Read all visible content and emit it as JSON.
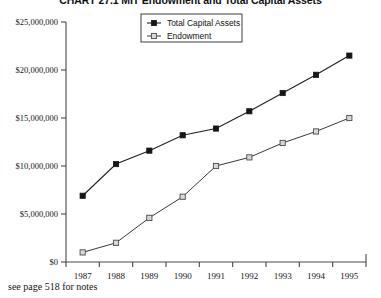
{
  "chart_data": {
    "type": "line",
    "title": "CHART 27.1 MIT Endowment and Total Capital Assets",
    "xlabel": "",
    "ylabel": "",
    "categories": [
      "1987",
      "1988",
      "1989",
      "1990",
      "1991",
      "1992",
      "1993",
      "1994",
      "1995"
    ],
    "series": [
      {
        "name": "Total Capital Assets",
        "marker": "filled-square",
        "values": [
          6900000,
          10200000,
          11600000,
          13200000,
          13900000,
          15700000,
          17600000,
          19500000,
          21500000
        ]
      },
      {
        "name": "Endowment",
        "marker": "open-square",
        "values": [
          1000000,
          2000000,
          4600000,
          6800000,
          10000000,
          10900000,
          12400000,
          13600000,
          15000000
        ]
      }
    ],
    "ylim": [
      0,
      25000000
    ],
    "ytick_values": [
      0,
      5000000,
      10000000,
      15000000,
      20000000,
      25000000
    ],
    "ytick_labels": [
      "$0",
      "$5,000,000",
      "$10,000,000",
      "$15,000,000",
      "$20,000,000",
      "$25,000,000"
    ],
    "grid": false,
    "legend_position": "top-center"
  },
  "legend": {
    "entries": [
      {
        "label": "Total Capital Assets"
      },
      {
        "label": "Endowment"
      }
    ]
  },
  "footnote": {
    "text": "see page 518 for notes"
  },
  "colors": {
    "series_a": "#161616",
    "series_b": "#d8d8d8",
    "axis": "#4a4a4a",
    "background": "#ffffff"
  }
}
